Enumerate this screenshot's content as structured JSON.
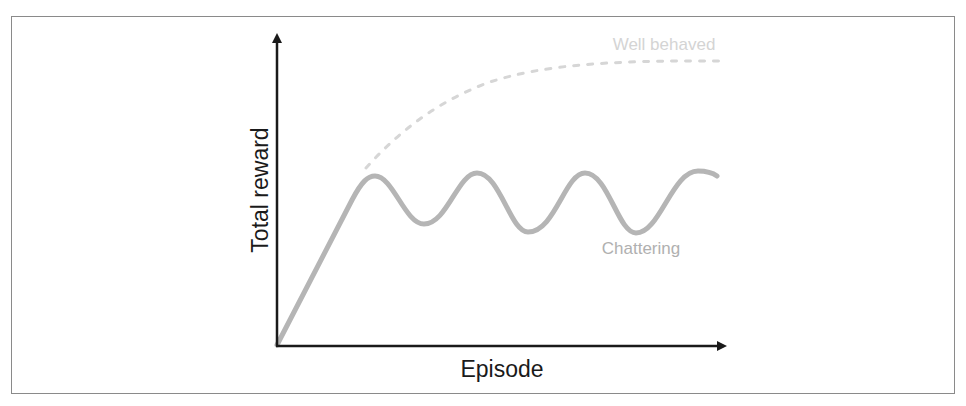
{
  "diagram": {
    "y_axis_label": "Total reward",
    "x_axis_label": "Episode",
    "series": [
      {
        "name": "Well behaved",
        "label": "Well behaved",
        "style": "dashed",
        "color": "#d4d4d4"
      },
      {
        "name": "Chattering",
        "label": "Chattering",
        "style": "solid",
        "color": "#b5b5b5"
      }
    ],
    "axis_color": "#1a1a1a",
    "frame_color": "#8a8a8a"
  }
}
